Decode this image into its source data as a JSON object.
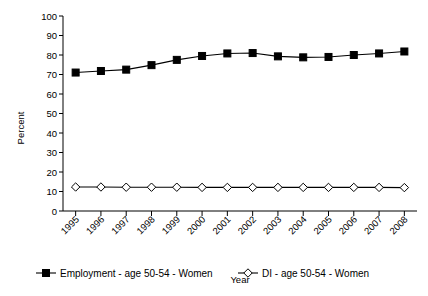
{
  "chart_data": {
    "type": "line",
    "title": "",
    "xlabel": "Year",
    "ylabel": "Percent",
    "categories": [
      "1995",
      "1996",
      "1997",
      "1998",
      "1999",
      "2000",
      "2001",
      "2002",
      "2003",
      "2004",
      "2005",
      "2006",
      "2007",
      "2008"
    ],
    "x": [
      1995,
      1996,
      1997,
      1998,
      1999,
      2000,
      2001,
      2002,
      2003,
      2004,
      2005,
      2006,
      2007,
      2008
    ],
    "ylim": [
      0,
      100
    ],
    "ytick_values": [
      0,
      10,
      20,
      30,
      40,
      50,
      60,
      70,
      80,
      90,
      100
    ],
    "ytick_labels": [
      "0",
      "10",
      "20",
      "30",
      "40",
      "50",
      "60",
      "70",
      "80",
      "90",
      "100"
    ],
    "grid": false,
    "legend_position": "bottom",
    "series": [
      {
        "name": "Employment - age 50-54 - Women",
        "marker": "filled-square",
        "color": "#000000",
        "values": [
          71,
          71.8,
          72.5,
          74.8,
          77.5,
          79.5,
          80.8,
          81.0,
          79.3,
          78.8,
          79.0,
          80.0,
          80.8,
          81.8
        ]
      },
      {
        "name": "DI - age 50-54 - Women",
        "marker": "open-diamond",
        "color": "#000000",
        "values": [
          12.3,
          12.3,
          12.2,
          12.2,
          12.2,
          12.1,
          12.1,
          12.1,
          12.1,
          12.1,
          12.1,
          12.1,
          12.1,
          12.0
        ]
      }
    ]
  },
  "axes": {
    "y_axis_title": "Percent",
    "x_axis_title": "Year"
  },
  "legend": {
    "items": [
      {
        "label": "Employment - age 50-54 - Women",
        "marker": "filled-square"
      },
      {
        "label": "DI - age 50-54 - Women",
        "marker": "open-diamond"
      }
    ]
  }
}
